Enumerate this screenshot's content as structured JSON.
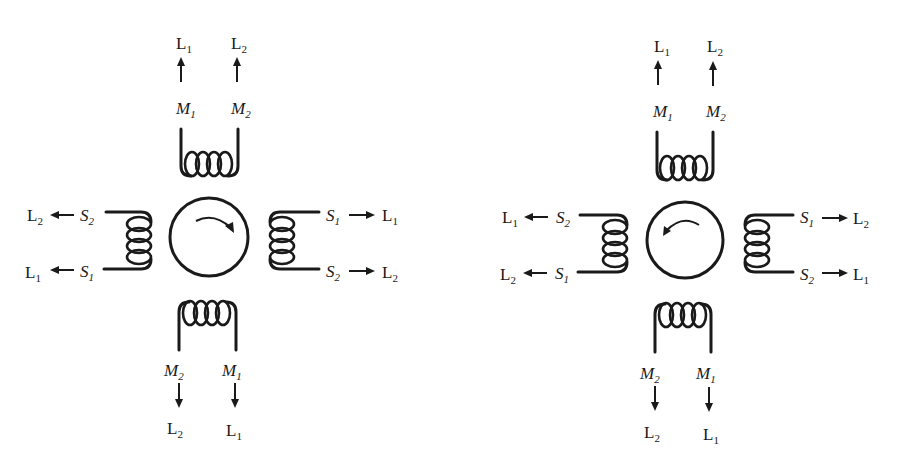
{
  "diagrams": [
    {
      "name": "left",
      "rotation": "clockwise",
      "rotor_center": [
        209,
        237
      ],
      "top": {
        "m_left": "M",
        "m_left_sub": "1",
        "m_right": "M",
        "m_right_sub": "2",
        "l_left": "L",
        "l_left_sub": "1",
        "l_right": "L",
        "l_right_sub": "2"
      },
      "bottom": {
        "m_left": "M",
        "m_left_sub": "2",
        "m_right": "M",
        "m_right_sub": "1",
        "l_left": "L",
        "l_left_sub": "2",
        "l_right": "L",
        "l_right_sub": "1"
      },
      "west": {
        "s_top": "S",
        "s_top_sub": "2",
        "l_top": "L",
        "l_top_sub": "2",
        "s_bot": "S",
        "s_bot_sub": "1",
        "l_bot": "L",
        "l_bot_sub": "1"
      },
      "east": {
        "s_top": "S",
        "s_top_sub": "1",
        "l_top": "L",
        "l_top_sub": "1",
        "s_bot": "S",
        "s_bot_sub": "2",
        "l_bot": "L",
        "l_bot_sub": "2"
      }
    },
    {
      "name": "right",
      "rotation": "counterclockwise",
      "rotor_center": [
        685,
        240
      ],
      "top": {
        "m_left": "M",
        "m_left_sub": "1",
        "m_right": "M",
        "m_right_sub": "2",
        "l_left": "L",
        "l_left_sub": "1",
        "l_right": "L",
        "l_right_sub": "2"
      },
      "bottom": {
        "m_left": "M",
        "m_left_sub": "2",
        "m_right": "M",
        "m_right_sub": "1",
        "l_left": "L",
        "l_left_sub": "2",
        "l_right": "L",
        "l_right_sub": "1"
      },
      "west": {
        "s_top": "S",
        "s_top_sub": "2",
        "l_top": "L",
        "l_top_sub": "1",
        "s_bot": "S",
        "s_bot_sub": "1",
        "l_bot": "L",
        "l_bot_sub": "2"
      },
      "east": {
        "s_top": "S",
        "s_top_sub": "1",
        "l_top": "L",
        "l_top_sub": "2",
        "s_bot": "S",
        "s_bot_sub": "2",
        "l_bot": "L",
        "l_bot_sub": "1"
      }
    }
  ],
  "colors": {
    "ink": "#1a1a1a",
    "background": "#ffffff"
  }
}
